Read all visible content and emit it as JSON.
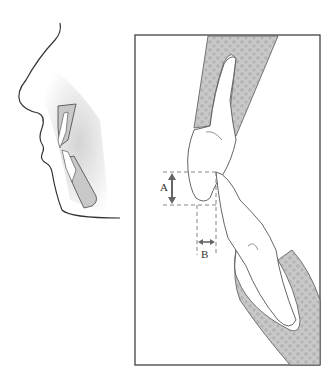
{
  "figure": {
    "labels": {
      "A": "A",
      "B": "B"
    },
    "label_meanings": {
      "A": "vertical overlap (overbite)",
      "B": "horizontal overlap (overjet)"
    },
    "colors": {
      "bone_fill": "#c8c8c8",
      "bone_pore": "#8a8a8a",
      "outline": "#333333",
      "arrow": "#666666",
      "dash": "#777777",
      "frame": "#333333"
    }
  }
}
